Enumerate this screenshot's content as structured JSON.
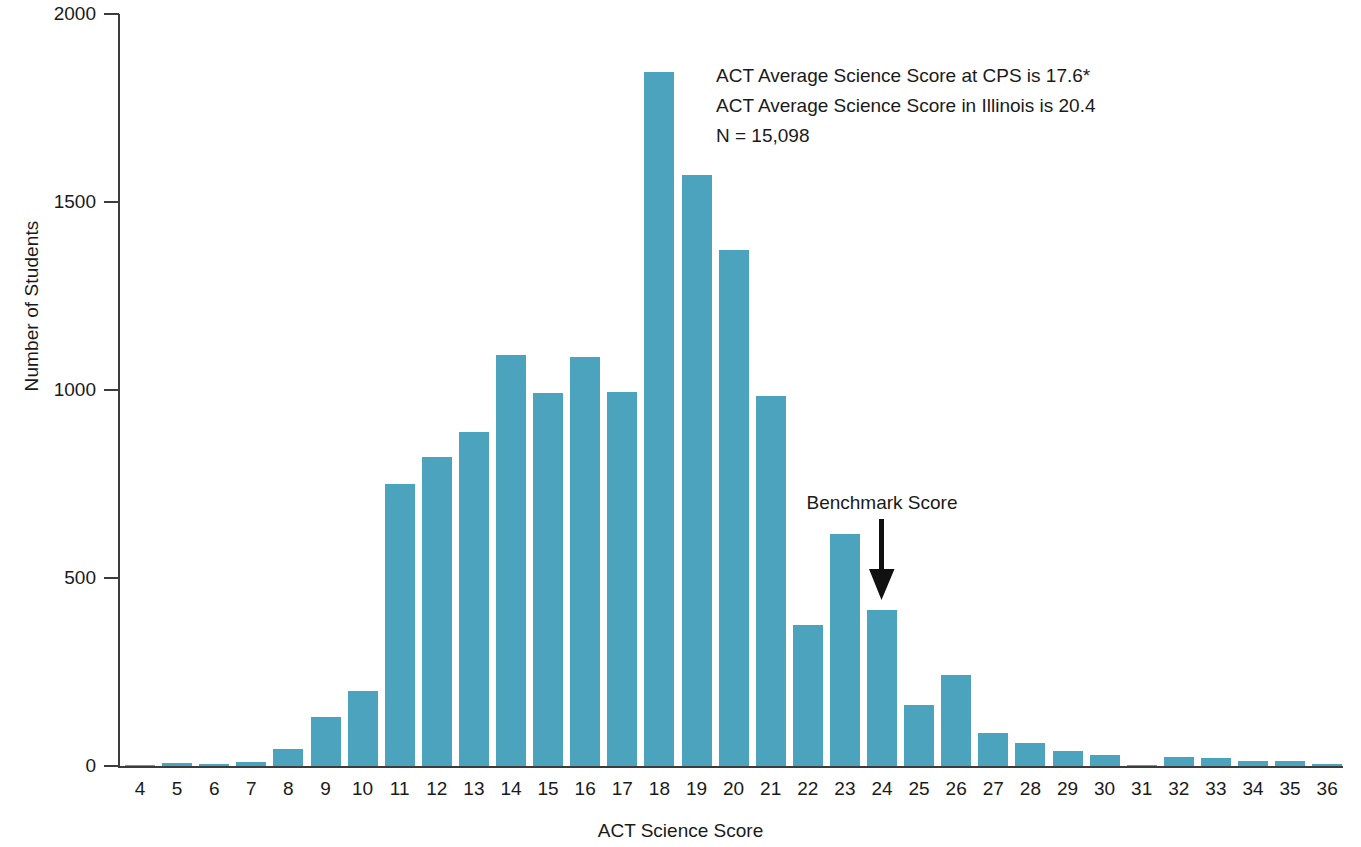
{
  "chart_data": {
    "type": "bar",
    "title": "",
    "xlabel": "ACT Science Score",
    "ylabel": "Number of Students",
    "ylim": [
      0,
      2000
    ],
    "yticks": [
      0,
      500,
      1000,
      1500,
      2000
    ],
    "ytick_labels": [
      "0",
      "500",
      "1000",
      "1500",
      "2000"
    ],
    "grid": false,
    "legend": null,
    "bar_color": "#4ba3bd",
    "axis_color": "#3c3c3c",
    "categories": [
      4,
      5,
      6,
      7,
      8,
      9,
      10,
      11,
      12,
      13,
      14,
      15,
      16,
      17,
      18,
      19,
      20,
      21,
      22,
      23,
      24,
      25,
      26,
      27,
      28,
      29,
      30,
      31,
      32,
      33,
      34,
      35,
      36
    ],
    "category_labels": [
      "4",
      "5",
      "6",
      "7",
      "8",
      "9",
      "10",
      "11",
      "12",
      "13",
      "14",
      "15",
      "16",
      "17",
      "18",
      "19",
      "20",
      "21",
      "22",
      "23",
      "24",
      "25",
      "26",
      "27",
      "28",
      "29",
      "30",
      "31",
      "32",
      "33",
      "34",
      "35",
      "36"
    ],
    "values": [
      2,
      8,
      6,
      10,
      45,
      130,
      200,
      750,
      822,
      888,
      1092,
      992,
      1088,
      995,
      1845,
      1572,
      1372,
      985,
      375,
      617,
      415,
      163,
      243,
      88,
      62,
      40,
      30,
      4,
      24,
      22,
      13,
      13,
      6
    ],
    "annotations": [
      {
        "name": "stats-annotation",
        "lines": [
          "ACT Average Science Score at CPS is 17.6*",
          "ACT Average Science Score in Illinois is 20.4",
          "N = 15,098"
        ]
      },
      {
        "name": "benchmark-annotation",
        "label": "Benchmark Score",
        "points_to_category": 24,
        "arrow": "down-arrow-icon"
      }
    ]
  },
  "chart": {
    "y_axis_title": "Number of Students",
    "x_axis_title": "ACT Science Score",
    "benchmark_label": "Benchmark Score",
    "stats_line_1": "ACT Average Science Score at CPS is 17.6*",
    "stats_line_2": "ACT Average Science Score in Illinois is 20.4",
    "stats_line_3": "N = 15,098"
  }
}
